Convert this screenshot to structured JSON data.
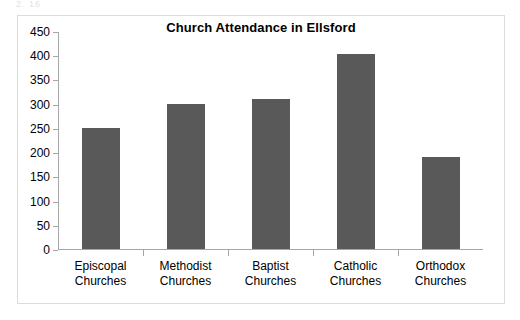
{
  "artifact": {
    "top_text": "2. 16"
  },
  "chart_data": {
    "type": "bar",
    "title": "Church Attendance in Ellsford",
    "xlabel": "",
    "ylabel": "",
    "categories": [
      "Episcopal Churches",
      "Methodist Churches",
      "Baptist Churches",
      "Catholic Churches",
      "Orthodox Churches"
    ],
    "category_lines": [
      [
        "Episcopal",
        "Churches"
      ],
      [
        "Methodist",
        "Churches"
      ],
      [
        "Baptist",
        "Churches"
      ],
      [
        "Catholic",
        "Churches"
      ],
      [
        "Orthodox",
        "Churches"
      ]
    ],
    "values": [
      250,
      300,
      310,
      403,
      190
    ],
    "ylim": [
      0,
      450
    ],
    "ytick_step": 50,
    "yticks": [
      0,
      50,
      100,
      150,
      200,
      250,
      300,
      350,
      400,
      450
    ],
    "ytick_labels": [
      "0",
      "50",
      "100",
      "150",
      "200",
      "250",
      "300",
      "350",
      "400",
      "450"
    ],
    "grid": false,
    "legend": false,
    "bar_color": "#595959",
    "axis_color": "#a6a6a6",
    "frame_color": "#dcdcdc"
  }
}
